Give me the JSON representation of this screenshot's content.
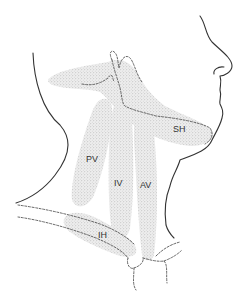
{
  "diagram": {
    "type": "anatomical illustration",
    "colors": {
      "outline": "#333333",
      "stipple": "#b5b5b5",
      "background": "#ffffff"
    },
    "regions": [
      {
        "id": "SH",
        "label": "SH"
      },
      {
        "id": "PV",
        "label": "PV"
      },
      {
        "id": "IV",
        "label": "IV"
      },
      {
        "id": "AV",
        "label": "AV"
      },
      {
        "id": "IH",
        "label": "IH"
      }
    ]
  }
}
